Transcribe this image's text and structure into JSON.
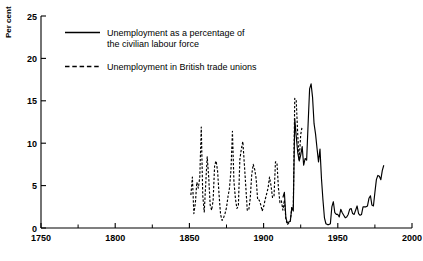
{
  "chart_data": {
    "type": "line",
    "title": "",
    "xlabel": "",
    "ylabel": "Per cent",
    "xlim": [
      1750,
      2000
    ],
    "ylim": [
      0,
      25
    ],
    "xticks": [
      1750,
      1800,
      1850,
      1900,
      1950,
      2000
    ],
    "xticklabels": [
      "1750",
      "1800",
      "1850",
      "1900",
      "1950",
      "2000"
    ],
    "xminorticks": [
      1775,
      1825,
      1875,
      1925,
      1975
    ],
    "yticks": [
      0,
      5,
      10,
      15,
      20,
      25
    ],
    "yticklabels": [
      "0",
      "5",
      "10",
      "15",
      "20",
      "25"
    ],
    "grid": false,
    "legend_position": "upper-left-inside",
    "series": [
      {
        "name": "Unemployment as a percentage of the civilian labour force",
        "style": "solid",
        "color": "#000000",
        "x": [
          1913,
          1914,
          1915,
          1916,
          1917,
          1918,
          1919,
          1920,
          1921,
          1922,
          1923,
          1924,
          1925,
          1926,
          1927,
          1928,
          1929,
          1930,
          1931,
          1932,
          1933,
          1934,
          1935,
          1936,
          1937,
          1938,
          1939,
          1940,
          1941,
          1942,
          1943,
          1944,
          1945,
          1946,
          1947,
          1948,
          1949,
          1950,
          1951,
          1952,
          1953,
          1954,
          1955,
          1956,
          1957,
          1958,
          1959,
          1960,
          1961,
          1962,
          1963,
          1964,
          1965,
          1966,
          1967,
          1968,
          1969,
          1970,
          1971,
          1972,
          1973,
          1974,
          1975,
          1976,
          1977,
          1978,
          1979,
          1980,
          1981
        ],
        "y": [
          3.6,
          4.2,
          1.2,
          0.6,
          0.7,
          0.8,
          2.4,
          2.0,
          12.9,
          10.8,
          8.9,
          7.9,
          8.6,
          9.6,
          7.4,
          8.2,
          8.0,
          12.3,
          16.4,
          17.0,
          15.4,
          12.3,
          11.1,
          9.4,
          7.8,
          9.3,
          5.8,
          3.3,
          1.2,
          0.5,
          0.4,
          0.4,
          0.5,
          2.5,
          3.1,
          1.8,
          1.6,
          1.6,
          1.3,
          2.2,
          1.8,
          1.5,
          1.2,
          1.3,
          1.6,
          2.2,
          2.3,
          1.7,
          1.6,
          2.1,
          2.6,
          1.7,
          1.5,
          1.6,
          2.5,
          2.5,
          2.5,
          2.6,
          3.5,
          3.8,
          2.7,
          2.6,
          4.2,
          5.7,
          6.2,
          6.1,
          5.7,
          6.8,
          7.4
        ],
        "historic_peak_1921": 17.0,
        "historic_peak_1932": 22.1
      },
      {
        "name": "Unemployment in British trade unions",
        "style": "dashed",
        "color": "#000000",
        "x": [
          1851,
          1852,
          1853,
          1854,
          1855,
          1856,
          1857,
          1858,
          1859,
          1860,
          1861,
          1862,
          1863,
          1864,
          1865,
          1866,
          1867,
          1868,
          1869,
          1870,
          1871,
          1872,
          1873,
          1874,
          1875,
          1876,
          1877,
          1878,
          1879,
          1880,
          1881,
          1882,
          1883,
          1884,
          1885,
          1886,
          1887,
          1888,
          1889,
          1890,
          1891,
          1892,
          1893,
          1894,
          1895,
          1896,
          1897,
          1898,
          1899,
          1900,
          1901,
          1902,
          1903,
          1904,
          1905,
          1906,
          1907,
          1908,
          1909,
          1910,
          1911,
          1912,
          1913,
          1914,
          1915,
          1916,
          1917,
          1918,
          1919,
          1920,
          1921,
          1922,
          1923,
          1924,
          1925,
          1926
        ],
        "y": [
          3.9,
          6.0,
          1.7,
          2.9,
          5.4,
          4.7,
          6.0,
          11.9,
          3.8,
          1.9,
          5.2,
          8.4,
          6.0,
          2.7,
          2.1,
          3.3,
          7.4,
          7.9,
          6.7,
          3.9,
          1.6,
          0.9,
          1.2,
          1.7,
          2.4,
          3.7,
          4.7,
          6.8,
          11.4,
          5.5,
          3.5,
          2.3,
          2.6,
          8.1,
          9.3,
          10.2,
          7.6,
          4.9,
          2.1,
          2.1,
          3.5,
          6.3,
          7.5,
          6.9,
          5.8,
          3.3,
          3.3,
          2.8,
          2.0,
          2.5,
          3.3,
          4.0,
          4.7,
          6.0,
          5.0,
          3.6,
          3.7,
          7.8,
          7.7,
          4.7,
          3.0,
          3.2,
          2.1,
          3.3,
          1.1,
          0.4,
          0.6,
          0.8,
          2.4,
          2.4,
          15.3,
          15.0,
          11.0,
          8.0,
          11.0,
          12.0
        ]
      }
    ],
    "legend": [
      {
        "style": "solid",
        "line1": "Unemployment as a percentage of",
        "line2": "the civilian labour force"
      },
      {
        "style": "dashed",
        "line1": "Unemployment in British trade unions",
        "line2": ""
      }
    ]
  }
}
